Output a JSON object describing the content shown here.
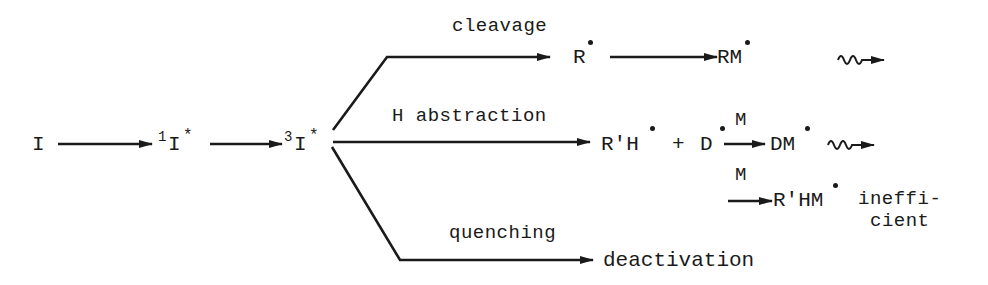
{
  "diagram": {
    "type": "reaction-scheme",
    "nodes": {
      "initiator": "I",
      "singlet": {
        "sup": "1",
        "base": "I",
        "mark": "*"
      },
      "triplet": {
        "sup": "3",
        "base": "I",
        "mark": "*"
      },
      "radical_R": "R",
      "radical_RM": "RM",
      "radical_RpH": "R'H",
      "plus": "+",
      "radical_D": "D",
      "radical_DM": "DM",
      "radical_RpHM": "R'HM",
      "deactivation": "deactivation"
    },
    "edge_labels": {
      "cleavage": "cleavage",
      "h_abstraction": "H abstraction",
      "quenching": "quenching",
      "monomer_top": "M",
      "monomer_bottom": "M"
    },
    "annotations": {
      "inefficient_line1": "ineffi-",
      "inefficient_line2": "cient"
    },
    "edges": [
      {
        "from": "I",
        "to": "1I*"
      },
      {
        "from": "1I*",
        "to": "3I*"
      },
      {
        "from": "3I*",
        "to": "R•",
        "label": "cleavage"
      },
      {
        "from": "R•",
        "to": "RM•"
      },
      {
        "from": "RM•",
        "to": "propagation",
        "style": "wavy"
      },
      {
        "from": "3I*",
        "to": "R'H• + D•",
        "label": "H abstraction"
      },
      {
        "from": "D•",
        "to": "DM•",
        "label": "M"
      },
      {
        "from": "DM•",
        "to": "propagation",
        "style": "wavy"
      },
      {
        "from": "R'H•",
        "to": "R'HM•",
        "label": "M",
        "note": "inefficient"
      },
      {
        "from": "3I*",
        "to": "deactivation",
        "label": "quenching"
      }
    ]
  }
}
